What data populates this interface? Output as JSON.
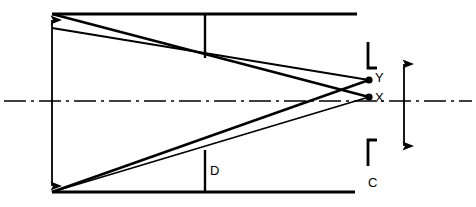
{
  "diagram": {
    "background_color": "#ffffff",
    "stroke_color": "#000000",
    "canvas": {
      "width": 476,
      "height": 207
    },
    "labels": {
      "point_y": "Y",
      "point_x": "X",
      "dimension_d": "D",
      "dimension_c": "C"
    },
    "geometry": {
      "top_line": {
        "x1": 52,
        "y1": 14,
        "x2": 357,
        "y2": 14
      },
      "bottom_line": {
        "x1": 52,
        "y1": 192,
        "x2": 355,
        "y2": 192
      },
      "centerline": {
        "x1": 4,
        "y1": 101,
        "x2": 472,
        "y2": 101
      },
      "top_tick": {
        "x": 205,
        "y1": 14,
        "y2": 58
      },
      "bottom_tick": {
        "x": 205,
        "y1": 192,
        "y2": 150
      },
      "left_dimension_arrow": {
        "x": 52,
        "y1": 18,
        "y2": 188
      },
      "right_dimension_arrow": {
        "x": 404,
        "y1": 62,
        "y2": 148
      },
      "top_apex": {
        "x": 52,
        "y": 14
      },
      "top_apex_secondary": {
        "x": 52,
        "y": 28
      },
      "bottom_apex": {
        "x": 52,
        "y": 192
      },
      "point_y_pos": {
        "x": 371,
        "y": 80
      },
      "point_x_pos": {
        "x": 371,
        "y": 97
      },
      "bracket_top": {
        "x": 368,
        "y_top": 44,
        "y_bot": 70,
        "foot": 9
      },
      "bracket_bottom": {
        "x": 368,
        "y_top": 138,
        "y_bot": 164,
        "foot": 9
      }
    },
    "rays": [
      {
        "name": "ray-top-to-x",
        "from": "top_apex",
        "to": "point_x"
      },
      {
        "name": "ray-top2-to-y",
        "from": "top_apex_secondary",
        "to": "point_y"
      },
      {
        "name": "ray-bottom-to-y",
        "from": "bottom_apex",
        "to": "point_y"
      },
      {
        "name": "ray-bottom-to-x",
        "from": "bottom_apex",
        "to": "point_x"
      }
    ]
  }
}
